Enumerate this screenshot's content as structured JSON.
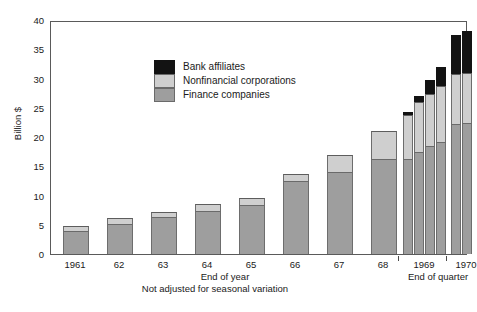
{
  "chart_data": {
    "type": "bar",
    "stacked": true,
    "title": "",
    "xlabel": "",
    "ylabel": "Billion $",
    "ylim": [
      0,
      40
    ],
    "yticks": [
      0,
      5,
      10,
      15,
      20,
      25,
      30,
      35,
      40
    ],
    "grid": false,
    "legend_position": "upper-left-inside",
    "footnote": "Not adjusted for seasonal variation",
    "group_labels": [
      {
        "label": "End of year",
        "span": "1961-68"
      },
      {
        "label": "End of quarter",
        "span": "1969-1970"
      }
    ],
    "categories": [
      "1961",
      "62",
      "63",
      "64",
      "65",
      "66",
      "67",
      "68",
      "1969",
      "1969",
      "1969",
      "1969",
      "1970",
      "1970"
    ],
    "tick_labels": [
      "1961",
      "62",
      "63",
      "64",
      "65",
      "66",
      "67",
      "68",
      "1969",
      "1970"
    ],
    "series": [
      {
        "name": "Finance companies",
        "color": "#9e9e9e",
        "values": [
          4.0,
          5.2,
          6.3,
          7.4,
          8.3,
          12.4,
          14.0,
          16.3,
          16.3,
          17.4,
          18.5,
          19.1,
          22.3,
          22.4
        ]
      },
      {
        "name": "Nonfinancial corporations",
        "color": "#cfcfcf",
        "values": [
          0.8,
          1.0,
          0.9,
          1.1,
          1.2,
          1.3,
          3.0,
          4.7,
          7.5,
          8.6,
          8.8,
          9.6,
          8.4,
          8.5
        ]
      },
      {
        "name": "Bank affiliates",
        "color": "#131313",
        "values": [
          0.0,
          0.0,
          0.0,
          0.0,
          0.0,
          0.0,
          0.0,
          0.0,
          0.5,
          1.0,
          2.5,
          3.3,
          6.8,
          7.3
        ]
      }
    ],
    "totals": [
      4.8,
      6.2,
      7.2,
      8.5,
      9.5,
      13.7,
      17.0,
      21.0,
      24.3,
      27.0,
      29.8,
      32.0,
      37.5,
      38.2
    ]
  },
  "legend": {
    "items": [
      {
        "label": "Bank affiliates",
        "swatch": "bank"
      },
      {
        "label": "Nonfinancial corporations",
        "swatch": "nonfin"
      },
      {
        "label": "Finance companies",
        "swatch": "finance"
      }
    ]
  }
}
